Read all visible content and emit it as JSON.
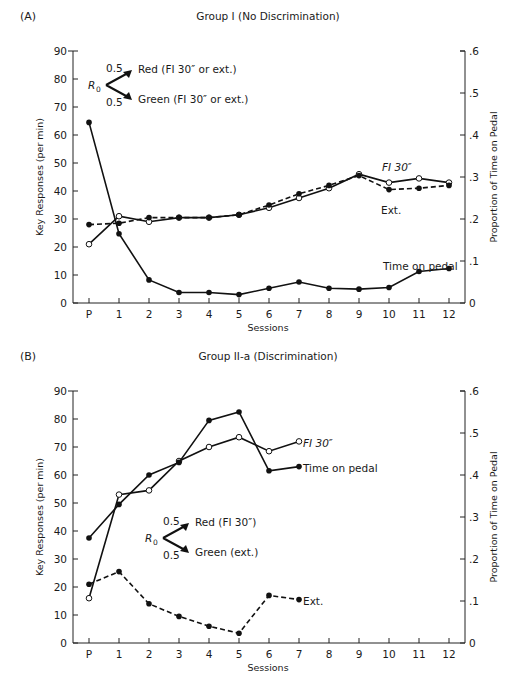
{
  "chart_data": [
    {
      "type": "line",
      "panel_label": "(A)",
      "title": "Group I (No Discrimination)",
      "xlabel": "Sessions",
      "ylabel": "Key Responses (per min)",
      "y2label": "Proportion of Time on Pedal",
      "categories": [
        "P",
        "1",
        "2",
        "3",
        "4",
        "5",
        "6",
        "7",
        "8",
        "9",
        "10",
        "11",
        "12"
      ],
      "ylim": [
        0,
        90
      ],
      "yticks": [
        0,
        10,
        20,
        30,
        40,
        50,
        60,
        70,
        80,
        90
      ],
      "y2lim": [
        0,
        0.6
      ],
      "y2ticks": [
        "0",
        ".1",
        ".2",
        ".3",
        ".4",
        ".5",
        ".6"
      ],
      "grid": false,
      "series": [
        {
          "name": "FI 30″",
          "axis": "left",
          "marker": "open-circle",
          "style": "solid",
          "values": [
            21,
            31,
            29,
            30.5,
            30.5,
            31.5,
            34,
            37.5,
            41,
            46,
            43,
            44.5,
            43
          ]
        },
        {
          "name": "Ext.",
          "axis": "left",
          "marker": "filled-circle",
          "style": "dashed",
          "values": [
            28,
            28.5,
            30.5,
            30.5,
            30.5,
            31.5,
            35,
            39,
            42,
            45.5,
            40.5,
            41,
            42
          ]
        },
        {
          "name": "Time on pedal",
          "axis": "right",
          "marker": "filled-circle",
          "style": "solid",
          "values": [
            0.43,
            0.165,
            0.055,
            0.025,
            0.025,
            0.02,
            0.035,
            0.05,
            0.035,
            0.033,
            0.037,
            0.075,
            0.082
          ]
        }
      ],
      "annotations": {
        "r0": "R",
        "r0_sub": "0",
        "upper_prob": "0.5",
        "upper_text": "Red (FI 30″ or ext.)",
        "lower_prob": "0.5",
        "lower_text": "Green (FI 30″ or ext.)",
        "label_fi": "FI 30″",
        "label_ext": "Ext.",
        "label_pedal": "Time on pedal"
      }
    },
    {
      "type": "line",
      "panel_label": "(B)",
      "title": "Group II-a (Discrimination)",
      "xlabel": "Sessions",
      "ylabel": "Key Responses (per min)",
      "y2label": "Proportion of Time on Pedal",
      "categories": [
        "P",
        "1",
        "2",
        "3",
        "4",
        "5",
        "6",
        "7",
        "8",
        "9",
        "10",
        "11",
        "12"
      ],
      "ylim": [
        0,
        90
      ],
      "yticks": [
        0,
        10,
        20,
        30,
        40,
        50,
        60,
        70,
        80,
        90
      ],
      "y2lim": [
        0,
        0.6
      ],
      "y2ticks": [
        "0",
        ".1",
        ".2",
        ".3",
        ".4",
        ".5",
        ".6"
      ],
      "grid": false,
      "series": [
        {
          "name": "FI 30″",
          "axis": "left",
          "marker": "open-circle",
          "style": "solid",
          "values": [
            16,
            53,
            54.5,
            65,
            70,
            73.5,
            68.5,
            72
          ]
        },
        {
          "name": "Time on pedal",
          "axis": "right",
          "marker": "filled-circle",
          "style": "solid",
          "values": [
            0.25,
            0.33,
            0.4,
            0.43,
            0.53,
            0.55,
            0.41,
            0.42
          ]
        },
        {
          "name": "Ext.",
          "axis": "left",
          "marker": "filled-circle",
          "style": "dashed",
          "values": [
            21,
            25.5,
            14,
            9.5,
            6,
            3.5,
            17,
            15.5
          ]
        }
      ],
      "annotations": {
        "r0": "R",
        "r0_sub": "0",
        "upper_prob": "0.5",
        "upper_text": "Red (FI 30″)",
        "lower_prob": "0.5",
        "lower_text": "Green (ext.)",
        "label_fi": "FI 30″",
        "label_ext": "Ext.",
        "label_pedal": "Time on pedal"
      }
    }
  ]
}
